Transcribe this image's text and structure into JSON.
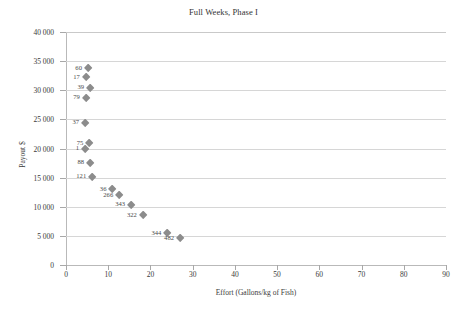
{
  "chart_data": {
    "type": "scatter",
    "title": "Full Weeks, Phase I",
    "xlabel": "Effort (Gallons/kg of Fish)",
    "ylabel": "Payout $",
    "xlim": [
      0,
      90
    ],
    "ylim": [
      0,
      40000
    ],
    "xticks": [
      0,
      10,
      20,
      30,
      40,
      50,
      60,
      70,
      80,
      90
    ],
    "yticks": [
      0,
      5000,
      10000,
      15000,
      20000,
      25000,
      30000,
      35000,
      40000
    ],
    "ytick_labels": [
      "0",
      "5 000",
      "10 000",
      "15 000",
      "20 000",
      "25 000",
      "30 000",
      "35 000",
      "40 000"
    ],
    "xtick_labels": [
      "0",
      "10",
      "20",
      "30",
      "40",
      "50",
      "60",
      "70",
      "80",
      "90"
    ],
    "grid": "horizontal",
    "legend": "none",
    "marker": "diamond",
    "marker_color": "#8c8c8c",
    "points": [
      {
        "label": "60",
        "x": 5.2,
        "y": 33800
      },
      {
        "label": "17",
        "x": 4.7,
        "y": 32200
      },
      {
        "label": "39",
        "x": 5.7,
        "y": 30400
      },
      {
        "label": "79",
        "x": 4.7,
        "y": 28700
      },
      {
        "label": "37",
        "x": 4.5,
        "y": 24400
      },
      {
        "label": "75",
        "x": 5.5,
        "y": 20900
      },
      {
        "label": "1",
        "x": 4.5,
        "y": 19900
      },
      {
        "label": "88",
        "x": 5.7,
        "y": 17500
      },
      {
        "label": "121",
        "x": 6.2,
        "y": 15100
      },
      {
        "label": "36",
        "x": 11.0,
        "y": 13000
      },
      {
        "label": "266",
        "x": 12.6,
        "y": 12000
      },
      {
        "label": "343",
        "x": 15.4,
        "y": 10300
      },
      {
        "label": "322",
        "x": 18.2,
        "y": 8500
      },
      {
        "label": "344",
        "x": 24.0,
        "y": 5400
      },
      {
        "label": "482",
        "x": 27.0,
        "y": 4600
      }
    ]
  }
}
